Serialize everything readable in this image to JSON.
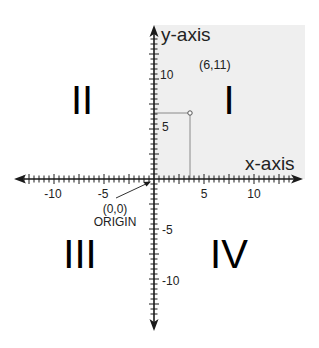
{
  "axes": {
    "x_label": "x-axis",
    "y_label": "y-axis",
    "x_ticks": [
      {
        "value": -10,
        "label": "-10"
      },
      {
        "value": -5,
        "label": "-5"
      },
      {
        "value": 5,
        "label": "5"
      },
      {
        "value": 10,
        "label": "10"
      }
    ],
    "y_ticks": [
      {
        "value": 10,
        "label": "10"
      },
      {
        "value": 5,
        "label": "5"
      },
      {
        "value": -5,
        "label": "-5"
      },
      {
        "value": -10,
        "label": "-10"
      }
    ]
  },
  "quadrants": {
    "q1": "I",
    "q2": "II",
    "q3": "III",
    "q4": "IV"
  },
  "point": {
    "x": 6,
    "y": 11,
    "label": "(6,11)"
  },
  "origin": {
    "coords": "(0,0)",
    "label": "ORIGIN"
  },
  "colors": {
    "shaded_quadrant": "#efefef",
    "axis": "#1a1a1a",
    "guide": "#8a8a8a"
  }
}
